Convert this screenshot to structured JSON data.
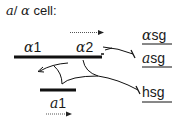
{
  "diagram": {
    "title": {
      "prefix": "a",
      "slash": "/",
      "greek": "α",
      "suffix": " cell:"
    },
    "genes": [
      {
        "id": "alpha1",
        "greek": "α",
        "num": "1"
      },
      {
        "id": "alpha2",
        "greek": "α",
        "num": "2"
      },
      {
        "id": "a1",
        "greek": "a",
        "num": "1"
      }
    ],
    "targets": [
      {
        "id": "alpha-sg",
        "greek": "α",
        "text": "sg"
      },
      {
        "id": "a-sg",
        "greek": "a",
        "text": "sg"
      },
      {
        "id": "hsg",
        "greek": "",
        "text": "hsg"
      }
    ],
    "colors": {
      "line": "#111111",
      "text": "#1a1a1a"
    }
  }
}
